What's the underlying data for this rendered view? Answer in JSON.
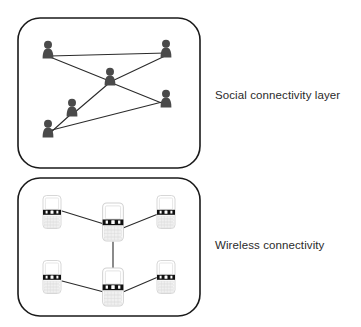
{
  "diagram": {
    "type": "two-layer network diagram",
    "background_color": "#ffffff",
    "panel_border_color": "#1a1a1a",
    "edge_color": "#2b2b2b",
    "person_color": "#4a4a4a",
    "phone_body_color": "#ffffff",
    "phone_band_color": "#111111",
    "label_color": "#2b2b2b"
  },
  "panels": [
    {
      "id": "social-layer",
      "label": "Social connectivity layer",
      "node_type": "person-icon",
      "node_count": 6,
      "edge_count": 5,
      "box": {
        "x": 18,
        "y": 18,
        "width": 182,
        "height": 150,
        "radius": 22
      },
      "nodes": [
        {
          "id": "p-top-left",
          "x": 48,
          "y": 52
        },
        {
          "id": "p-top-right",
          "x": 166,
          "y": 51
        },
        {
          "id": "p-hub",
          "x": 110,
          "y": 79
        },
        {
          "id": "p-mid-right",
          "x": 166,
          "y": 101
        },
        {
          "id": "p-mid-left",
          "x": 72,
          "y": 110
        },
        {
          "id": "p-bottom-left",
          "x": 48,
          "y": 131
        }
      ],
      "edges": [
        {
          "from": "p-top-left",
          "to": "p-hub"
        },
        {
          "from": "p-hub",
          "to": "p-top-right"
        },
        {
          "from": "p-hub",
          "to": "p-mid-right"
        },
        {
          "from": "p-hub",
          "to": "p-mid-left"
        },
        {
          "from": "p-mid-left",
          "to": "p-bottom-left"
        }
      ]
    },
    {
      "id": "wireless-layer",
      "label": "Wireless connectivity",
      "node_type": "smartphone-icon",
      "node_count": 6,
      "edge_count": 5,
      "box": {
        "x": 18,
        "y": 178,
        "width": 182,
        "height": 138,
        "radius": 22
      },
      "nodes": [
        {
          "id": "d-top-left",
          "x": 52,
          "y": 212,
          "scale": 1.0
        },
        {
          "id": "d-top-center",
          "x": 113,
          "y": 222,
          "scale": 1.15
        },
        {
          "id": "d-top-right",
          "x": 166,
          "y": 212,
          "scale": 1.0
        },
        {
          "id": "d-bottom-left",
          "x": 52,
          "y": 277,
          "scale": 1.0
        },
        {
          "id": "d-bottom-center",
          "x": 113,
          "y": 287,
          "scale": 1.15
        },
        {
          "id": "d-bottom-right",
          "x": 166,
          "y": 277,
          "scale": 1.0
        }
      ],
      "edges": [
        {
          "from": "d-top-left",
          "to": "d-top-center"
        },
        {
          "from": "d-top-center",
          "to": "d-top-right"
        },
        {
          "from": "d-top-center",
          "to": "d-bottom-center"
        },
        {
          "from": "d-bottom-left",
          "to": "d-bottom-center"
        },
        {
          "from": "d-bottom-center",
          "to": "d-bottom-right"
        }
      ]
    }
  ],
  "labels": {
    "social": "Social connectivity layer",
    "wireless": "Wireless connectivity"
  }
}
